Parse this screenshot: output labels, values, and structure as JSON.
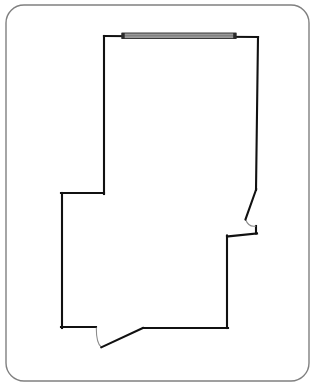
{
  "document": {
    "kind": "architectural-floor-plan",
    "title": "Floor Plan",
    "canvas": {
      "width": 318,
      "height": 388,
      "background": "#ffffff"
    }
  },
  "colors": {
    "background": "#ffffff",
    "frame_stroke": "#808080",
    "wall_stroke": "#111111",
    "window_fill": "#9a9a9a",
    "window_stroke": "#2b2b2b",
    "door_stroke": "#111111",
    "door_arc_stroke": "#8c8c8c"
  },
  "frame": {
    "name": "page-border",
    "x": 6,
    "y": 5,
    "width": 303,
    "height": 376,
    "corner_radius": 18,
    "stroke_width": 1.4
  },
  "geometry": {
    "wall_stroke_width": 2.1,
    "outline_points": "104,36 104,193 62,193 62,327 96,327 143,328 227,328 227,237 256,237 256,233 255,226 256,190 258,37 104,36",
    "segments": [
      {
        "name": "wall-top",
        "from": [
          104,
          36
        ],
        "to": [
          258,
          37
        ],
        "orientation": "horizontal"
      },
      {
        "name": "wall-right-upper",
        "from": [
          258,
          37
        ],
        "to": [
          256,
          190
        ],
        "orientation": "vertical-slanted"
      },
      {
        "name": "wall-right-lower",
        "from": [
          256,
          226
        ],
        "to": [
          256,
          233
        ],
        "orientation": "vertical"
      },
      {
        "name": "wall-notch-top",
        "from": [
          256,
          233
        ],
        "to": [
          227,
          237
        ],
        "orientation": "horizontal"
      },
      {
        "name": "wall-right-bottom",
        "from": [
          227,
          237
        ],
        "to": [
          227,
          328
        ],
        "orientation": "vertical"
      },
      {
        "name": "wall-bottom-right",
        "from": [
          227,
          328
        ],
        "to": [
          143,
          328
        ],
        "orientation": "horizontal"
      },
      {
        "name": "wall-bottom-left",
        "from": [
          96,
          327
        ],
        "to": [
          62,
          327
        ],
        "orientation": "horizontal"
      },
      {
        "name": "wall-left-lower",
        "from": [
          62,
          327
        ],
        "to": [
          62,
          193
        ],
        "orientation": "vertical"
      },
      {
        "name": "wall-left-jog",
        "from": [
          62,
          193
        ],
        "to": [
          104,
          193
        ],
        "orientation": "horizontal"
      },
      {
        "name": "wall-left-upper",
        "from": [
          104,
          193
        ],
        "to": [
          104,
          36
        ],
        "orientation": "vertical"
      }
    ]
  },
  "openings": [
    {
      "id": "window-top",
      "type": "window",
      "label": "Window",
      "wall": "wall-top",
      "x": 122,
      "y": 33,
      "width": 114,
      "height": 5.5,
      "end_cap_width": 3
    },
    {
      "id": "door-right",
      "type": "door",
      "label": "Door",
      "wall": "wall-right-upper",
      "hinge": [
        256,
        190
      ],
      "leaf_end": [
        245,
        219
      ],
      "arc_end": [
        256,
        226
      ],
      "swing": "inward"
    },
    {
      "id": "door-bottom",
      "type": "door",
      "label": "Door",
      "wall": "wall-bottom",
      "hinge": [
        96,
        327
      ],
      "pivot": [
        101,
        347
      ],
      "leaf_end": [
        143,
        328
      ],
      "swing": "inward"
    }
  ]
}
